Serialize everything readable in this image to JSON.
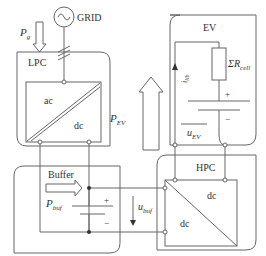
{
  "diagram": {
    "type": "power-electronics-block-diagram",
    "colors": {
      "stroke": "#666666",
      "text": "#333333",
      "background": "#ffffff"
    },
    "source": {
      "label": "GRID",
      "icon": "ac-source-icon"
    },
    "blocks": {
      "lpc": {
        "label": "LPC",
        "converter": {
          "top_left": "ac",
          "bottom_right": "dc"
        }
      },
      "ev": {
        "label": "EV",
        "resistor": "ΣR",
        "resistor_sub": "cell",
        "current": "i",
        "current_sub": "lib",
        "voltage": "u",
        "voltage_sub": "EV",
        "plus": "+",
        "minus": "−"
      },
      "buffer": {
        "label": "Buffer",
        "power": "P",
        "power_sub": "buf",
        "plus": "+",
        "minus": "−"
      },
      "hpc": {
        "label": "HPC",
        "converter": {
          "top_right": "dc",
          "bottom_left": "dc"
        }
      }
    },
    "arrows": {
      "pg": {
        "main": "P",
        "sub": "g"
      },
      "pev": {
        "main": "P",
        "sub": "EV"
      },
      "ubuf": {
        "main": "u",
        "sub": "buf"
      }
    }
  }
}
